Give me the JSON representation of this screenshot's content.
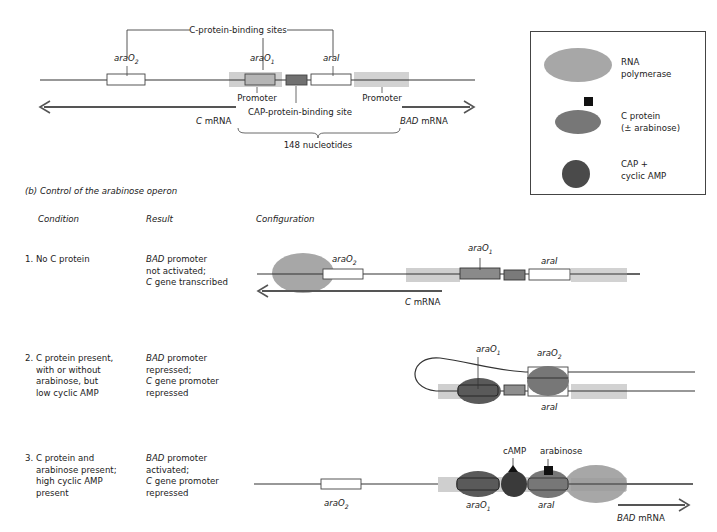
{
  "top_diagram": {
    "bracket_label": "C-protein-binding sites",
    "sites": {
      "araO2": {
        "base": "araO",
        "sub": "2"
      },
      "araO1": {
        "base": "araO",
        "sub": "1"
      },
      "araI": {
        "base": "araI"
      }
    },
    "promoter_left": "Promoter",
    "promoter_right": "Promoter",
    "cap_site": "CAP-protein-binding site",
    "c_mrna": {
      "gene": "C",
      "suffix": " mRNA"
    },
    "bad_mrna": {
      "gene": "BAD",
      "suffix": " mRNA"
    },
    "span_label": "148 nucleotides"
  },
  "legend": {
    "items": [
      {
        "symbol": "rna-polymerase",
        "label_line1": "RNA",
        "label_line2": "polymerase",
        "color": "#a7a7a7"
      },
      {
        "symbol": "c-protein",
        "label_line1": "C protein",
        "label_line2": "(± arabinose)",
        "color": "#777777"
      },
      {
        "symbol": "cap-camp",
        "label_line1": "CAP +",
        "label_line2": "cyclic AMP",
        "color": "#4a4a4a"
      }
    ]
  },
  "section_b": {
    "title_prefix": "(b)",
    "title": "Control of the arabinose operon",
    "columns": [
      "Condition",
      "Result",
      "Configuration"
    ],
    "rows": [
      {
        "condition": [
          "1. No C protein"
        ],
        "result": [
          {
            "gene": "BAD",
            "text": " promoter"
          },
          {
            "text": "not activated;"
          },
          {
            "gene": "C",
            "text": " gene transcribed"
          }
        ],
        "config_labels": {
          "araO2": "araO2",
          "araO1": "araO1",
          "araI": "araI",
          "mrna": "C mRNA"
        }
      },
      {
        "condition": [
          "2. C protein present,",
          "with or without",
          "arabinose, but",
          "low cyclic AMP"
        ],
        "result": [
          {
            "gene": "BAD",
            "text": " promoter"
          },
          {
            "text": "repressed;"
          },
          {
            "gene": "C",
            "text": " gene promoter"
          },
          {
            "text": "repressed"
          }
        ],
        "config_labels": {
          "araO1": "araO1",
          "araO2": "araO2",
          "araI": "araI"
        }
      },
      {
        "condition": [
          "3. C protein and",
          "arabinose present;",
          "high cyclic AMP",
          "present"
        ],
        "result": [
          {
            "gene": "BAD",
            "text": " promoter"
          },
          {
            "text": "activated;"
          },
          {
            "gene": "C",
            "text": " gene promoter"
          },
          {
            "text": "repressed"
          }
        ],
        "config_labels": {
          "araO2": "araO2",
          "araO1": "araO1",
          "araI": "araI",
          "camp": "cAMP",
          "arabinose": "arabinose",
          "mrna": "BAD mRNA"
        }
      }
    ]
  },
  "colors": {
    "dna": "#333333",
    "promoter": "#cfcfcf",
    "araO1_box": "#b5b5b5",
    "cap_box": "#707070",
    "rna_pol": "#a7a7a7",
    "c_protein": "#777777",
    "cap": "#4a4a4a",
    "mrna_arrow": "#555555"
  }
}
